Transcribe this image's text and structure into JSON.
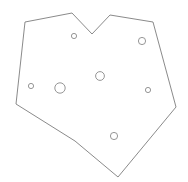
{
  "canvas": {
    "width": 188,
    "height": 182,
    "background_color": "#ffffff",
    "title": "Polygon Outline Drawing"
  },
  "drawing": {
    "name": "cad-polygon-with-holes",
    "stroke_color": "#7d7d7d",
    "fill_color": "#ffffff",
    "stroke_width": 0.9,
    "outline": {
      "name": "outer-boundary",
      "closed": true,
      "vertices": [
        [
          25,
          22
        ],
        [
          72,
          13
        ],
        [
          92,
          34
        ],
        [
          110,
          15
        ],
        [
          153,
          22
        ],
        [
          176,
          107
        ],
        [
          118,
          177
        ],
        [
          75,
          141
        ],
        [
          16,
          104
        ]
      ],
      "vertex_count": 9
    },
    "holes": [
      {
        "name": "hole-top-left",
        "cx": 74,
        "cy": 36,
        "r": 2.6,
        "stroke_color": "#8a8a8a"
      },
      {
        "name": "hole-top-right",
        "cx": 142,
        "cy": 41,
        "r": 3.6,
        "stroke_color": "#8a8a8a"
      },
      {
        "name": "hole-left-small",
        "cx": 31,
        "cy": 86,
        "r": 2.6,
        "stroke_color": "#8a8a8a"
      },
      {
        "name": "hole-left-large",
        "cx": 60,
        "cy": 88,
        "r": 5.2,
        "stroke_color": "#8a8a8a"
      },
      {
        "name": "hole-center",
        "cx": 100,
        "cy": 76,
        "r": 4.4,
        "stroke_color": "#8a8a8a"
      },
      {
        "name": "hole-right-small",
        "cx": 148,
        "cy": 90,
        "r": 2.6,
        "stroke_color": "#8a8a8a"
      },
      {
        "name": "hole-bottom",
        "cx": 114,
        "cy": 136,
        "r": 3.6,
        "stroke_color": "#8a8a8a"
      }
    ],
    "hole_count": 7
  }
}
